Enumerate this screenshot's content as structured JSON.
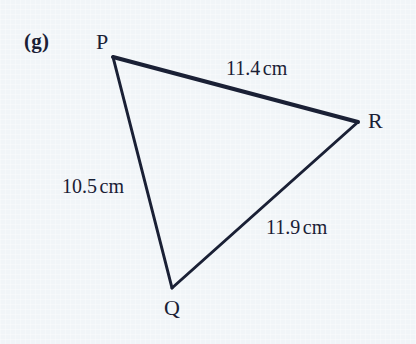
{
  "figure": {
    "part_label": "(g)",
    "shape": "triangle",
    "background_color": "#f1f5f8",
    "ink_color": "#1a2035",
    "vertices": [
      {
        "name": "P",
        "label": "P",
        "x": 113,
        "y": 57,
        "label_x": 103,
        "label_y": 42
      },
      {
        "name": "R",
        "label": "R",
        "x": 358,
        "y": 122,
        "label_x": 376,
        "label_y": 121
      },
      {
        "name": "Q",
        "label": "Q",
        "x": 172,
        "y": 288,
        "label_x": 172,
        "label_y": 309
      }
    ],
    "sides": [
      {
        "name": "PR",
        "from": "P",
        "to": "R",
        "value": "11.4",
        "unit": "cm",
        "label_x": 265,
        "label_y": 69,
        "stroke_width": 4
      },
      {
        "name": "PQ",
        "from": "P",
        "to": "Q",
        "value": "10.5",
        "unit": "cm",
        "label_x": 102,
        "label_y": 186,
        "stroke_width": 3
      },
      {
        "name": "QR",
        "from": "Q",
        "to": "R",
        "value": "11.9",
        "unit": "cm",
        "label_x": 305,
        "label_y": 227,
        "stroke_width": 3
      }
    ]
  },
  "chart_data": {
    "type": "diagram",
    "title": "(g)",
    "shape": "triangle",
    "vertex_labels": [
      "P",
      "Q",
      "R"
    ],
    "vertex_points": [
      [
        113,
        57
      ],
      [
        172,
        288
      ],
      [
        358,
        122
      ]
    ],
    "edges": [
      {
        "edge": "PR",
        "length": 11.4,
        "unit": "cm"
      },
      {
        "edge": "PQ",
        "length": 10.5,
        "unit": "cm"
      },
      {
        "edge": "QR",
        "length": 11.9,
        "unit": "cm"
      }
    ],
    "xlabel": "",
    "ylabel": "",
    "grid": false,
    "legend": false
  }
}
